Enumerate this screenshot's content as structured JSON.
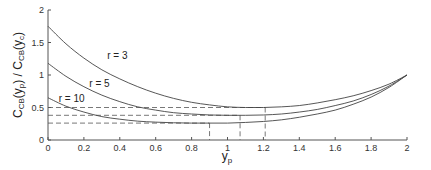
{
  "chart_data": {
    "type": "line",
    "title": "",
    "xlabel": "y_p",
    "ylabel": "C_CB(y_p) / C_CB(y_c)",
    "xlim": [
      0,
      2
    ],
    "ylim": [
      0,
      2
    ],
    "grid": false,
    "legend": "none (inline curve labels)",
    "x_ticks": [
      "0",
      "0.2",
      "0.4",
      "0.6",
      "0.8",
      "1",
      "1.2",
      "1.4",
      "1.6",
      "1.8",
      "2"
    ],
    "y_ticks": [
      "0",
      "0.5",
      "1",
      "1.5",
      "2"
    ],
    "x": [
      0,
      0.1,
      0.2,
      0.3,
      0.4,
      0.5,
      0.6,
      0.7,
      0.8,
      0.9,
      1.0,
      1.1,
      1.2,
      1.3,
      1.4,
      1.5,
      1.6,
      1.7,
      1.8,
      1.9,
      2.0
    ],
    "series": [
      {
        "name": "r = 3",
        "values": [
          1.75,
          1.48,
          1.26,
          1.08,
          0.94,
          0.82,
          0.72,
          0.64,
          0.58,
          0.54,
          0.51,
          0.5,
          0.5,
          0.51,
          0.53,
          0.57,
          0.62,
          0.68,
          0.76,
          0.86,
          1.0
        ]
      },
      {
        "name": "r = 5",
        "values": [
          1.18,
          0.98,
          0.82,
          0.69,
          0.59,
          0.51,
          0.46,
          0.42,
          0.4,
          0.385,
          0.38,
          0.38,
          0.385,
          0.4,
          0.43,
          0.47,
          0.53,
          0.6,
          0.7,
          0.83,
          1.0
        ]
      },
      {
        "name": "r = 10",
        "values": [
          0.65,
          0.52,
          0.43,
          0.36,
          0.32,
          0.29,
          0.275,
          0.265,
          0.26,
          0.26,
          0.26,
          0.27,
          0.285,
          0.31,
          0.35,
          0.4,
          0.46,
          0.55,
          0.66,
          0.81,
          1.0
        ]
      }
    ],
    "annotations": {
      "minima": [
        {
          "series": "r = 3",
          "x": 1.21,
          "y": 0.5
        },
        {
          "series": "r = 5",
          "x": 1.07,
          "y": 0.38
        },
        {
          "series": "r = 10",
          "x": 0.9,
          "y": 0.26
        }
      ],
      "dashed_reference_lines": "horizontal at each minimum value from x=0, vertical at each minimum x down to axis"
    },
    "curve_labels": [
      {
        "text": "r = 3",
        "x": 0.33,
        "y": 1.25
      },
      {
        "text": "r = 5",
        "x": 0.23,
        "y": 0.82
      },
      {
        "text": "r = 10",
        "x": 0.06,
        "y": 0.58
      }
    ]
  }
}
